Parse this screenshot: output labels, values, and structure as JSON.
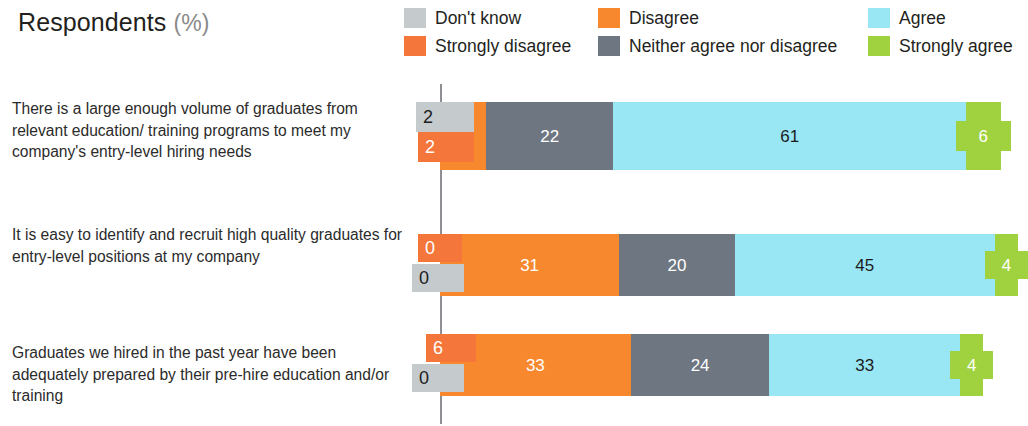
{
  "header": {
    "title": "Respondents",
    "unit": "(%)"
  },
  "legend": {
    "items": [
      {
        "label": "Don't know",
        "color": "#c5cacd",
        "col": 0,
        "row": 0
      },
      {
        "label": "Strongly disagree",
        "color": "#f4763a",
        "col": 0,
        "row": 1
      },
      {
        "label": "Disagree",
        "color": "#f8882e",
        "col": 1,
        "row": 0
      },
      {
        "label": "Neither agree nor disagree",
        "color": "#6d7681",
        "col": 1,
        "row": 1
      },
      {
        "label": "Agree",
        "color": "#99e6f5",
        "col": 2,
        "row": 0
      },
      {
        "label": "Strongly agree",
        "color": "#9fd23e",
        "col": 2,
        "row": 1
      }
    ]
  },
  "chart_data": {
    "type": "bar",
    "subtype": "diverging-stacked-bar",
    "title": "Respondents (%)",
    "xlabel": "",
    "ylabel": "",
    "grid": false,
    "legend_position": "top-right",
    "value_unit": "percent",
    "axis_baseline": 0,
    "categories": [
      "There is a large enough volume of graduates from relevant education/ training programs to meet my company's entry-level hiring needs",
      "It is easy to identify and recruit high quality graduates for entry-level positions at my company",
      "Graduates we hired in the past year have been adequately prepared by their pre-hire education and/or training"
    ],
    "series": [
      {
        "name": "Don't know",
        "color": "#c5cacd",
        "values": [
          2,
          0,
          0
        ]
      },
      {
        "name": "Strongly disagree",
        "color": "#f4763a",
        "values": [
          2,
          0,
          6
        ]
      },
      {
        "name": "Disagree",
        "color": "#f8882e",
        "values": [
          8,
          31,
          33
        ]
      },
      {
        "name": "Neither agree nor disagree",
        "color": "#6d7681",
        "values": [
          22,
          20,
          24
        ]
      },
      {
        "name": "Agree",
        "color": "#99e6f5",
        "values": [
          61,
          45,
          33
        ]
      },
      {
        "name": "Strongly agree",
        "color": "#9fd23e",
        "values": [
          6,
          4,
          4
        ]
      }
    ]
  },
  "rows": [
    {
      "label": "There is a large enough volume of graduates from relevant education/ training programs to meet my company's entry-level hiring needs",
      "dont_know": "2",
      "strongly_disagree": "2",
      "disagree": "8",
      "neither": "22",
      "agree": "61",
      "strongly_agree": "6"
    },
    {
      "label": "It is easy to identify and recruit high quality graduates for entry-level positions at my company",
      "dont_know": "0",
      "strongly_disagree": "0",
      "disagree": "31",
      "neither": "20",
      "agree": "45",
      "strongly_agree": "4"
    },
    {
      "label": "Graduates we hired in the past year have been adequately prepared by their pre-hire education and/or training",
      "dont_know": "0",
      "strongly_disagree": "6",
      "disagree": "33",
      "neither": "24",
      "agree": "33",
      "strongly_agree": "4"
    }
  ]
}
